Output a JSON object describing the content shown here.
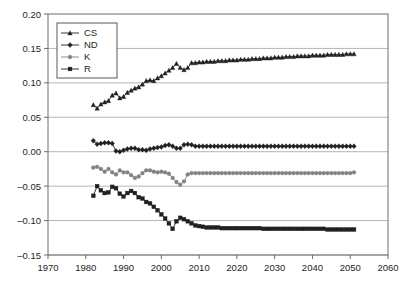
{
  "chart_data": {
    "type": "line",
    "title": "",
    "xlabel": "",
    "ylabel": "",
    "xlim": [
      1970,
      2060
    ],
    "ylim": [
      -0.15,
      0.2
    ],
    "xticks": [
      1970,
      1980,
      1990,
      2000,
      2010,
      2020,
      2030,
      2040,
      2050,
      2060
    ],
    "yticks": [
      0.2,
      0.15,
      0.1,
      0.05,
      0.0,
      -0.05,
      -0.1,
      -0.15
    ],
    "ytick_labels": [
      "0.20",
      "0.15",
      "0.10",
      "0.05",
      "0.00",
      "–0.05",
      "–0.10",
      "–0.15"
    ],
    "xtick_labels": [
      "1970",
      "1980",
      "1990",
      "2000",
      "2010",
      "2020",
      "2030",
      "2040",
      "2050",
      "2060"
    ],
    "grid": "horizontal",
    "legend_position": "top-left",
    "legend_entries": [
      {
        "label": "CS",
        "marker": "triangle",
        "color": "#231f20"
      },
      {
        "label": "ND",
        "marker": "diamond",
        "color": "#231f20"
      },
      {
        "label": "K",
        "marker": "circle",
        "color": "#808285"
      },
      {
        "label": "R",
        "marker": "square",
        "color": "#231f20"
      }
    ],
    "x": [
      1982,
      1983,
      1984,
      1985,
      1986,
      1987,
      1988,
      1989,
      1990,
      1991,
      1992,
      1993,
      1994,
      1995,
      1996,
      1997,
      1998,
      1999,
      2000,
      2001,
      2002,
      2003,
      2004,
      2005,
      2006,
      2007,
      2008,
      2009,
      2010,
      2011,
      2012,
      2013,
      2014,
      2015,
      2016,
      2017,
      2018,
      2019,
      2020,
      2021,
      2022,
      2023,
      2024,
      2025,
      2026,
      2027,
      2028,
      2029,
      2030,
      2031,
      2032,
      2033,
      2034,
      2035,
      2036,
      2037,
      2038,
      2039,
      2040,
      2041,
      2042,
      2043,
      2044,
      2045,
      2046,
      2047,
      2048,
      2049,
      2050,
      2051
    ],
    "series": [
      {
        "name": "CS",
        "marker": "triangle",
        "color": "#231f20",
        "values": [
          0.068,
          0.063,
          0.069,
          0.072,
          0.074,
          0.082,
          0.085,
          0.078,
          0.08,
          0.086,
          0.089,
          0.092,
          0.094,
          0.098,
          0.103,
          0.104,
          0.103,
          0.107,
          0.11,
          0.114,
          0.118,
          0.122,
          0.128,
          0.122,
          0.119,
          0.122,
          0.129,
          0.129,
          0.13,
          0.13,
          0.131,
          0.131,
          0.131,
          0.132,
          0.132,
          0.132,
          0.133,
          0.133,
          0.133,
          0.134,
          0.134,
          0.134,
          0.135,
          0.135,
          0.135,
          0.136,
          0.136,
          0.136,
          0.137,
          0.137,
          0.137,
          0.138,
          0.138,
          0.138,
          0.139,
          0.139,
          0.139,
          0.139,
          0.14,
          0.14,
          0.14,
          0.14,
          0.141,
          0.141,
          0.141,
          0.141,
          0.141,
          0.142,
          0.142,
          0.142
        ]
      },
      {
        "name": "ND",
        "marker": "diamond",
        "color": "#231f20",
        "values": [
          0.016,
          0.011,
          0.012,
          0.013,
          0.013,
          0.012,
          0.001,
          0.0,
          0.002,
          0.004,
          0.005,
          0.005,
          0.003,
          0.003,
          0.002,
          0.004,
          0.005,
          0.006,
          0.007,
          0.009,
          0.01,
          0.008,
          0.005,
          0.005,
          0.01,
          0.011,
          0.01,
          0.008,
          0.008,
          0.008,
          0.008,
          0.008,
          0.008,
          0.008,
          0.008,
          0.008,
          0.008,
          0.008,
          0.008,
          0.008,
          0.008,
          0.008,
          0.008,
          0.008,
          0.008,
          0.008,
          0.008,
          0.008,
          0.008,
          0.008,
          0.008,
          0.008,
          0.008,
          0.008,
          0.008,
          0.008,
          0.008,
          0.008,
          0.008,
          0.008,
          0.008,
          0.008,
          0.008,
          0.008,
          0.008,
          0.008,
          0.008,
          0.008,
          0.008,
          0.008
        ]
      },
      {
        "name": "K",
        "marker": "circle",
        "color": "#808285",
        "values": [
          -0.023,
          -0.022,
          -0.025,
          -0.029,
          -0.025,
          -0.03,
          -0.033,
          -0.027,
          -0.03,
          -0.03,
          -0.034,
          -0.038,
          -0.036,
          -0.031,
          -0.027,
          -0.027,
          -0.029,
          -0.03,
          -0.029,
          -0.03,
          -0.032,
          -0.038,
          -0.044,
          -0.048,
          -0.043,
          -0.033,
          -0.031,
          -0.031,
          -0.031,
          -0.031,
          -0.031,
          -0.031,
          -0.031,
          -0.031,
          -0.031,
          -0.031,
          -0.031,
          -0.031,
          -0.031,
          -0.031,
          -0.031,
          -0.031,
          -0.031,
          -0.031,
          -0.031,
          -0.031,
          -0.031,
          -0.031,
          -0.031,
          -0.031,
          -0.031,
          -0.031,
          -0.031,
          -0.031,
          -0.031,
          -0.031,
          -0.031,
          -0.031,
          -0.031,
          -0.031,
          -0.031,
          -0.031,
          -0.031,
          -0.031,
          -0.031,
          -0.031,
          -0.031,
          -0.031,
          -0.031,
          -0.03
        ]
      },
      {
        "name": "R",
        "marker": "square",
        "color": "#231f20",
        "values": [
          -0.064,
          -0.05,
          -0.056,
          -0.06,
          -0.059,
          -0.051,
          -0.053,
          -0.061,
          -0.065,
          -0.06,
          -0.057,
          -0.06,
          -0.066,
          -0.068,
          -0.073,
          -0.075,
          -0.08,
          -0.085,
          -0.091,
          -0.097,
          -0.104,
          -0.112,
          -0.101,
          -0.096,
          -0.098,
          -0.101,
          -0.104,
          -0.107,
          -0.108,
          -0.109,
          -0.11,
          -0.11,
          -0.11,
          -0.11,
          -0.111,
          -0.111,
          -0.111,
          -0.111,
          -0.111,
          -0.111,
          -0.111,
          -0.111,
          -0.111,
          -0.111,
          -0.111,
          -0.112,
          -0.112,
          -0.112,
          -0.112,
          -0.112,
          -0.112,
          -0.112,
          -0.112,
          -0.112,
          -0.112,
          -0.112,
          -0.112,
          -0.112,
          -0.112,
          -0.112,
          -0.112,
          -0.112,
          -0.113,
          -0.113,
          -0.113,
          -0.113,
          -0.113,
          -0.113,
          -0.113,
          -0.113
        ]
      }
    ]
  }
}
